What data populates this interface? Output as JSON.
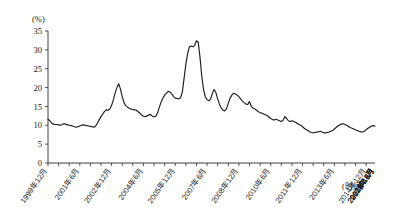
{
  "chart_data": {
    "type": "line",
    "title": "",
    "subtitle": "",
    "xlabel": "(时间)",
    "ylabel": "(%)",
    "ylim": [
      0,
      35
    ],
    "y_ticks": [
      0,
      5,
      10,
      15,
      20,
      25,
      30,
      35
    ],
    "grid": false,
    "legend": null,
    "x_tick_labels": [
      "1999年12月",
      "2001年6月",
      "2002年12月",
      "2004年6月",
      "2005年12月",
      "2007年6月",
      "2008年12月",
      "2010年6月",
      "2011年12月",
      "2013年6月",
      "2014年12月",
      "2016年6月",
      "2017年12月",
      "2019年6月",
      "2020年12月",
      "2022年6月"
    ],
    "x_tick_interval_months": 18,
    "x_start": "1999年12月",
    "x_end": "2022年6月",
    "series": [
      {
        "name": "M2同比增速",
        "values": [
          11.6,
          11.2,
          10.6,
          10.3,
          10.2,
          10.2,
          10.1,
          10.0,
          10.2,
          10.4,
          10.3,
          10.1,
          10.0,
          9.9,
          9.8,
          9.6,
          9.5,
          9.6,
          9.8,
          10.0,
          10.1,
          10.0,
          9.9,
          9.8,
          9.7,
          9.6,
          9.5,
          9.8,
          10.6,
          11.5,
          12.3,
          13.0,
          13.7,
          14.1,
          14.0,
          14.3,
          15.3,
          16.8,
          18.6,
          20.0,
          21.0,
          19.6,
          17.6,
          16.0,
          15.2,
          14.8,
          14.5,
          14.3,
          14.2,
          14.1,
          14.0,
          13.6,
          13.2,
          12.7,
          12.4,
          12.3,
          12.5,
          12.7,
          12.9,
          12.4,
          12.2,
          12.4,
          13.3,
          14.8,
          16.2,
          17.2,
          18.0,
          18.5,
          19.0,
          18.8,
          18.3,
          17.6,
          17.2,
          17.1,
          17.0,
          17.3,
          18.8,
          22.5,
          26.2,
          29.0,
          30.8,
          31.0,
          30.8,
          31.2,
          32.4,
          32.0,
          28.0,
          23.0,
          19.5,
          17.5,
          16.8,
          16.5,
          17.0,
          18.5,
          19.5,
          18.6,
          17.0,
          15.6,
          14.6,
          14.0,
          13.8,
          14.4,
          15.8,
          17.2,
          18.0,
          18.5,
          18.3,
          18.0,
          17.6,
          17.0,
          16.4,
          16.0,
          15.6,
          15.5,
          16.3,
          15.0,
          14.6,
          14.3,
          14.0,
          13.6,
          13.4,
          13.2,
          13.0,
          12.8,
          12.6,
          12.2,
          11.8,
          11.5,
          11.4,
          11.6,
          11.4,
          11.2,
          11.0,
          11.3,
          12.3,
          11.8,
          11.2,
          11.0,
          11.2,
          11.0,
          10.8,
          10.5,
          10.2,
          10.0,
          9.6,
          9.2,
          8.9,
          8.6,
          8.3,
          8.1,
          8.0,
          8.1,
          8.2,
          8.3,
          8.4,
          8.2,
          8.0,
          8.0,
          8.1,
          8.2,
          8.4,
          8.6,
          9.0,
          9.4,
          9.8,
          10.1,
          10.3,
          10.4,
          10.2,
          10.0,
          9.7,
          9.4,
          9.2,
          9.0,
          8.8,
          8.6,
          8.4,
          8.3,
          8.2,
          8.4,
          8.8,
          9.2,
          9.5,
          9.8,
          9.9,
          9.8
        ]
      }
    ],
    "annotations": [],
    "notes": {
      "min_approx": 8.0,
      "max_approx": 32.4,
      "start_value": 11.6,
      "end_value": 9.8
    }
  },
  "axes": {
    "y_unit_label": "(%)",
    "x_caption": "(时间)"
  },
  "colors": {
    "line": "#1c1c1c",
    "axis": "#2a2a2a",
    "background": "#ffffff",
    "text": "#1a1a1a"
  }
}
